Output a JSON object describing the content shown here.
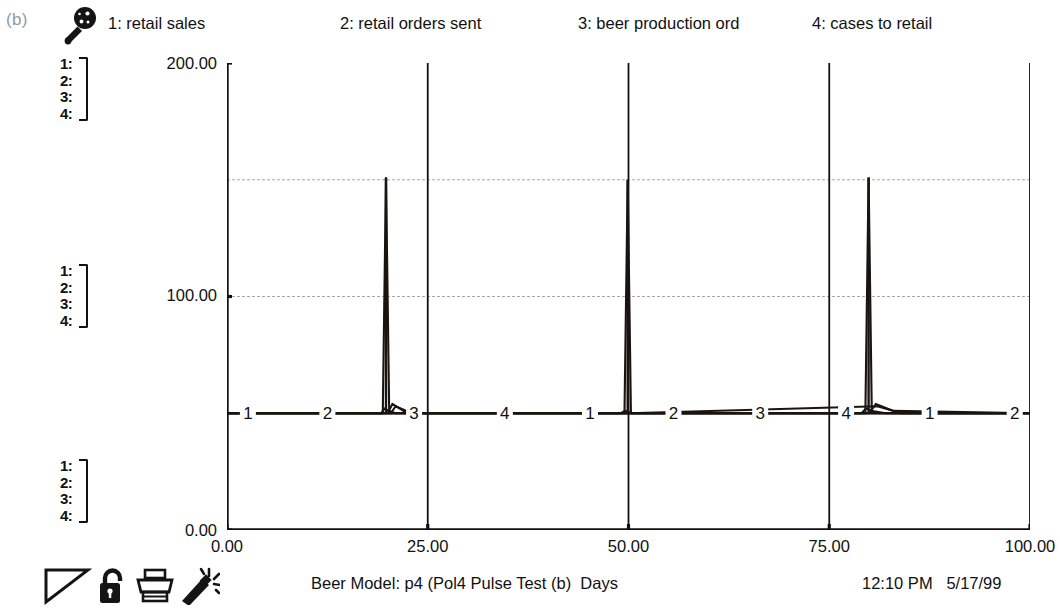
{
  "figure": {
    "label": "(b)"
  },
  "legend": {
    "icon": "magnifier-icon",
    "entries": [
      {
        "index": "1",
        "label": "1: retail sales"
      },
      {
        "index": "2",
        "label": "2: retail orders sent"
      },
      {
        "index": "3",
        "label": "3: beer production ord"
      },
      {
        "index": "4",
        "label": "4: cases to retail"
      }
    ]
  },
  "scale_groups": [
    {
      "name": "top",
      "rows": [
        "1:",
        "2:",
        "3:",
        "4:"
      ]
    },
    {
      "name": "middle",
      "rows": [
        "1:",
        "2:",
        "3:",
        "4:"
      ]
    },
    {
      "name": "bottom",
      "rows": [
        "1:",
        "2:",
        "3:",
        "4:"
      ]
    }
  ],
  "footer": {
    "title": "Beer Model: p4 (Pol4 Pulse Test (b)  Days",
    "time": "12:10 PM",
    "date": "5/17/99",
    "timestamp": "12:10 PM   5/17/99",
    "icons": [
      "triangle-icon",
      "lock-icon",
      "printer-icon",
      "wand-icon"
    ]
  },
  "colors": {
    "line": "#1a1411",
    "axis": "#111111",
    "grid": "#9a9a9a",
    "background": "#ffffff",
    "caption": "#8e9aa6"
  },
  "chart_data": {
    "type": "line",
    "title": "Beer Model: p4 (Pol4 Pulse Test (b)  Days",
    "xlabel": "Days",
    "ylabel": "",
    "xlim": [
      0,
      100
    ],
    "ylim": [
      0,
      200
    ],
    "xticks": [
      0,
      25,
      50,
      75,
      100
    ],
    "xtick_labels": [
      "0.00",
      "25.00",
      "50.00",
      "75.00",
      "100.00"
    ],
    "yticks": [
      0,
      100,
      200
    ],
    "ytick_labels": [
      "0.00",
      "100.00",
      "200.00"
    ],
    "gridlines": {
      "horizontal": [
        100,
        150
      ],
      "vertical": [
        25,
        50,
        75
      ]
    },
    "grid": true,
    "legend_position": "top",
    "series_marker_values": [
      "1",
      "2",
      "3",
      "4"
    ],
    "series": [
      {
        "name": "retail sales",
        "index": "1",
        "marker": "1",
        "baseline": 50,
        "points": [
          {
            "x": 0,
            "y": 50
          },
          {
            "x": 18,
            "y": 50
          },
          {
            "x": 19.2,
            "y": 50
          },
          {
            "x": 19.6,
            "y": 52
          },
          {
            "x": 20.2,
            "y": 51
          },
          {
            "x": 21,
            "y": 50
          },
          {
            "x": 49,
            "y": 50
          },
          {
            "x": 49.6,
            "y": 51
          },
          {
            "x": 50.4,
            "y": 50
          },
          {
            "x": 79,
            "y": 50
          },
          {
            "x": 79.6,
            "y": 52
          },
          {
            "x": 80.4,
            "y": 51
          },
          {
            "x": 82,
            "y": 50
          },
          {
            "x": 100,
            "y": 50
          }
        ]
      },
      {
        "name": "retail orders sent",
        "index": "2",
        "marker": "2",
        "baseline": 50,
        "points": [
          {
            "x": 0,
            "y": 50
          },
          {
            "x": 19.4,
            "y": 50
          },
          {
            "x": 19.8,
            "y": 151
          },
          {
            "x": 20.2,
            "y": 50
          },
          {
            "x": 49.5,
            "y": 50
          },
          {
            "x": 49.9,
            "y": 150
          },
          {
            "x": 50.3,
            "y": 50
          },
          {
            "x": 79.5,
            "y": 50
          },
          {
            "x": 79.9,
            "y": 151
          },
          {
            "x": 80.3,
            "y": 50
          },
          {
            "x": 100,
            "y": 50
          }
        ]
      },
      {
        "name": "beer production ord",
        "index": "3",
        "marker": "3",
        "baseline": 50,
        "points": [
          {
            "x": 0,
            "y": 50
          },
          {
            "x": 20,
            "y": 50
          },
          {
            "x": 20.6,
            "y": 54
          },
          {
            "x": 22,
            "y": 51
          },
          {
            "x": 24,
            "y": 50
          },
          {
            "x": 50,
            "y": 50
          },
          {
            "x": 80,
            "y": 50
          },
          {
            "x": 80.8,
            "y": 54
          },
          {
            "x": 83,
            "y": 51
          },
          {
            "x": 100,
            "y": 50
          }
        ]
      },
      {
        "name": "cases to retail",
        "index": "4",
        "marker": "4",
        "baseline": 50,
        "points": [
          {
            "x": 0,
            "y": 50
          },
          {
            "x": 20.4,
            "y": 50
          },
          {
            "x": 21,
            "y": 53
          },
          {
            "x": 23,
            "y": 50
          },
          {
            "x": 50,
            "y": 50
          },
          {
            "x": 81,
            "y": 53
          },
          {
            "x": 84,
            "y": 50
          },
          {
            "x": 100,
            "y": 50
          }
        ]
      }
    ],
    "marker_positions": {
      "y_value": 50,
      "x_values": [
        2.6,
        12.5,
        23.3,
        34.6,
        45.2,
        55.6,
        66.4,
        77.1,
        87.5,
        98.1
      ]
    },
    "spikes": [
      {
        "x": 19.8,
        "peak": 151
      },
      {
        "x": 49.9,
        "peak": 150
      },
      {
        "x": 79.9,
        "peak": 151
      }
    ]
  }
}
